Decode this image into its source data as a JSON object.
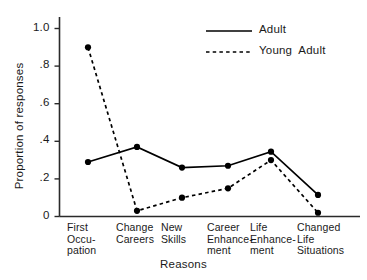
{
  "chart_data": {
    "type": "line",
    "title": "",
    "xlabel": "Reasons",
    "ylabel": "Proportion of responses",
    "ylim": [
      0,
      1.0
    ],
    "ytick_values": [
      0,
      0.2,
      0.4,
      0.6,
      0.8,
      1.0
    ],
    "ytick_labels": [
      "0",
      ".2",
      ".4",
      ".6",
      ".8",
      "1.0"
    ],
    "grid": false,
    "legend_position": "top-right",
    "categories": [
      "First\nOccu-\npation",
      "Change\nCareers",
      "New\nSkills",
      "Career\nEnhance-\nment",
      "Life\nEnhance-\nment",
      "Changed\nLife\nSituations"
    ],
    "series": [
      {
        "name": "Adult",
        "style": "solid",
        "color": "#000000",
        "values": [
          0.29,
          0.37,
          0.26,
          0.27,
          0.345,
          0.115
        ]
      },
      {
        "name": "Young Adult",
        "style": "dashed",
        "color": "#000000",
        "values": [
          0.9,
          0.03,
          0.1,
          0.15,
          0.3,
          0.02
        ]
      }
    ]
  },
  "legend": {
    "items": [
      {
        "label": "Adult",
        "style": "solid"
      },
      {
        "label": "Young  Adult",
        "style": "dashed"
      }
    ]
  },
  "axes": {
    "y_title": "Proportion of responses",
    "x_title": "Reasons"
  }
}
